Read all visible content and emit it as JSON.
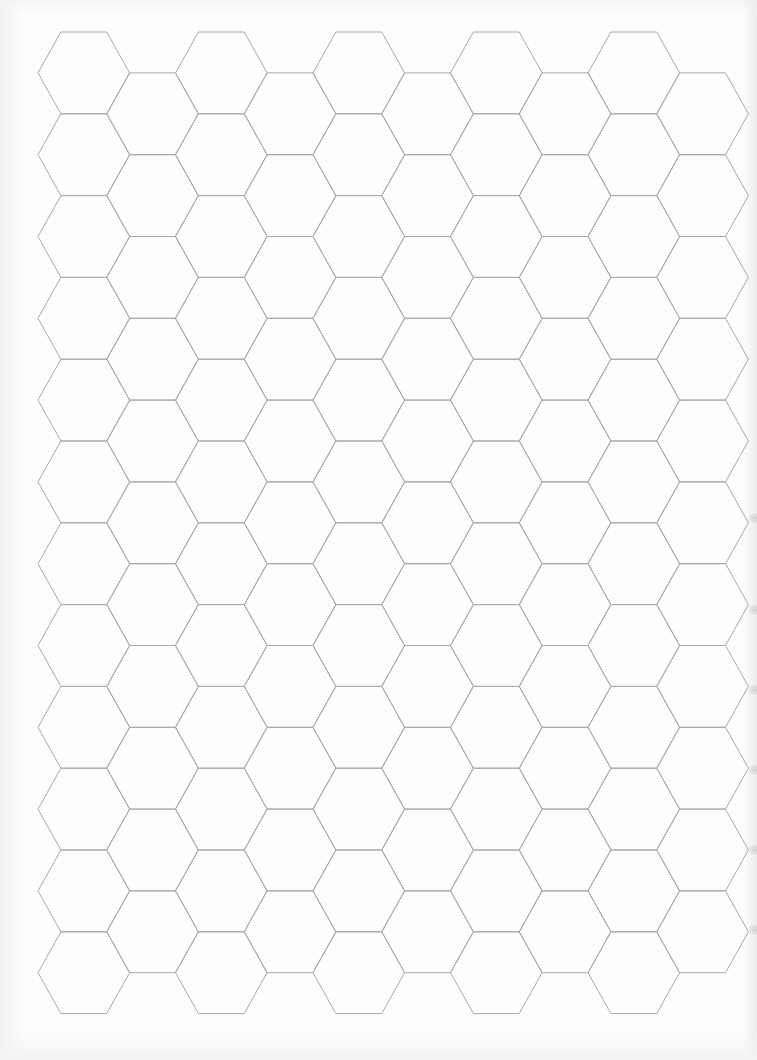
{
  "sheet": {
    "type": "hexagonal graph paper",
    "background_color": "#fdfdfd",
    "line_color": "#a9a9a9"
  },
  "grid": {
    "orientation": "flat-top",
    "columns": 10,
    "rows_even_columns": 12,
    "rows_odd_columns": 11,
    "origin_left_vertex_x": 38,
    "origin_top_y": 32,
    "side": 45.8,
    "col_pitch": 68.75,
    "row_pitch": 81.8
  },
  "right_edge_marks_y": [
    518,
    610,
    690,
    770,
    850,
    930
  ]
}
